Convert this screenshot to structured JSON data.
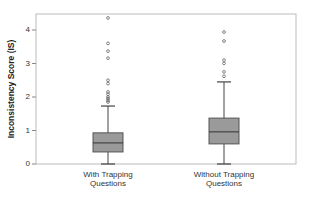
{
  "chart_data": {
    "type": "boxplot",
    "title": "",
    "xlabel": "",
    "ylabel": "Inconsistency Score (IS)",
    "ylim": [
      0,
      4.5
    ],
    "yticks": [
      0,
      1,
      2,
      3,
      4
    ],
    "grid": false,
    "legend": null,
    "categories": [
      "With Trapping Questions",
      "Without Trapping Questions"
    ],
    "category_lines": [
      [
        "With Trapping",
        "Questions"
      ],
      [
        "Without Trapping",
        "Questions"
      ]
    ],
    "series": [
      {
        "name": "With Trapping Questions",
        "whisker_low": 0.0,
        "q1": 0.36,
        "median": 0.63,
        "q3": 0.93,
        "whisker_high": 1.73,
        "outliers": [
          4.36,
          3.6,
          3.37,
          3.16,
          2.5,
          2.4,
          2.15,
          2.08,
          2.0,
          1.95,
          1.9,
          1.85
        ]
      },
      {
        "name": "Without Trapping Questions",
        "whisker_low": 0.0,
        "q1": 0.6,
        "median": 0.96,
        "q3": 1.37,
        "whisker_high": 2.45,
        "outliers": [
          3.94,
          3.67,
          3.1,
          3.0,
          2.75,
          2.62
        ]
      }
    ],
    "colors": {
      "box_fill": "#9a9a9a",
      "box_stroke": "#555555",
      "whisker": "#444444",
      "outlier": "#666666",
      "frame": "#bbbbbb"
    }
  }
}
